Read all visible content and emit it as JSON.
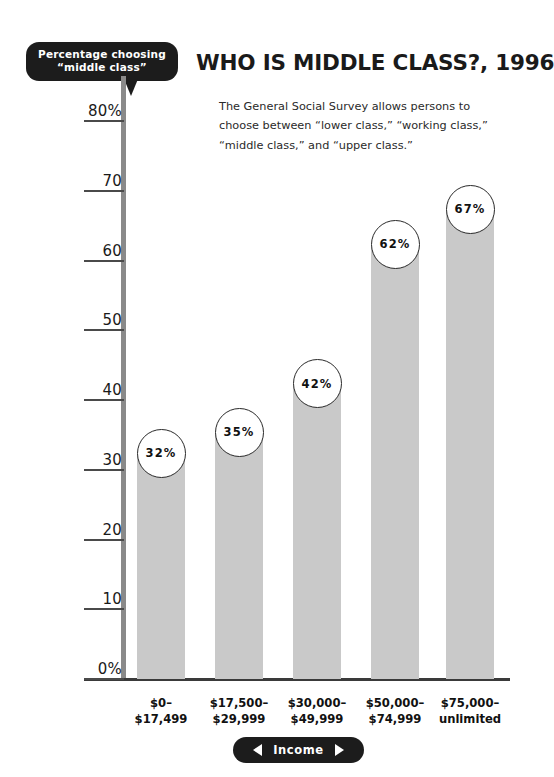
{
  "callout": {
    "line1": "Percentage choosing",
    "line2": "“middle class”"
  },
  "title": "WHO IS MIDDLE CLASS?, 1996",
  "deck": "The General Social Survey allows persons to choose between “lower class,” “working class,” “middle class,” and “upper class.”",
  "axis_label": {
    "text": "Income",
    "left_arrow": "left-arrow-icon",
    "right_arrow": "right-arrow-icon"
  },
  "colors": {
    "bar": "#c9c9c9",
    "pill": "#1c1c1c",
    "axis": "#8a8a8a",
    "baseline": "#3a3a3a",
    "text": "#1a1a1a"
  },
  "chart_data": {
    "type": "bar",
    "title": "WHO IS MIDDLE CLASS?, 1996",
    "subtitle": "The General Social Survey allows persons to choose between “lower class,” “working class,” “middle class,” and “upper class.”",
    "xlabel": "Income",
    "ylabel": "Percentage choosing “middle class”",
    "ylim": [
      0,
      80
    ],
    "yticks": [
      0,
      10,
      20,
      30,
      40,
      50,
      60,
      70,
      80
    ],
    "ytick_labels": [
      "0%",
      "10",
      "20",
      "30",
      "40",
      "50",
      "60",
      "70",
      "80%"
    ],
    "grid": false,
    "legend": "none",
    "categories": [
      "$0–\n$17,499",
      "$17,500–\n$29,999",
      "$30,000–\n$49,999",
      "$50,000–\n$74,999",
      "$75,000–\nunlimited"
    ],
    "category_lines": [
      [
        "$0–",
        "$17,499"
      ],
      [
        "$17,500–",
        "$29,999"
      ],
      [
        "$30,000–",
        "$49,999"
      ],
      [
        "$50,000–",
        "$74,999"
      ],
      [
        "$75,000–",
        "unlimited"
      ]
    ],
    "values": [
      32,
      35,
      42,
      62,
      67
    ],
    "value_labels": [
      "32%",
      "35%",
      "42%",
      "62%",
      "67%"
    ]
  }
}
